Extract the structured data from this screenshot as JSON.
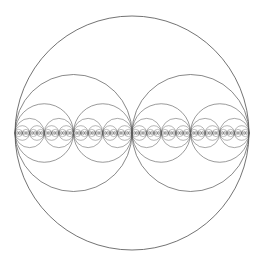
{
  "diagram": {
    "type": "recursive-circle-packing",
    "canvas": {
      "width": 262,
      "height": 263,
      "background": "#ffffff"
    },
    "outer_circle": {
      "cx": 132,
      "cy": 133,
      "r": 117
    },
    "levels": 8,
    "subdivision": "binary",
    "stroke_color": "#5a5a5a",
    "stroke_width_base": 0.9,
    "stroke_opacity": 0.95
  }
}
